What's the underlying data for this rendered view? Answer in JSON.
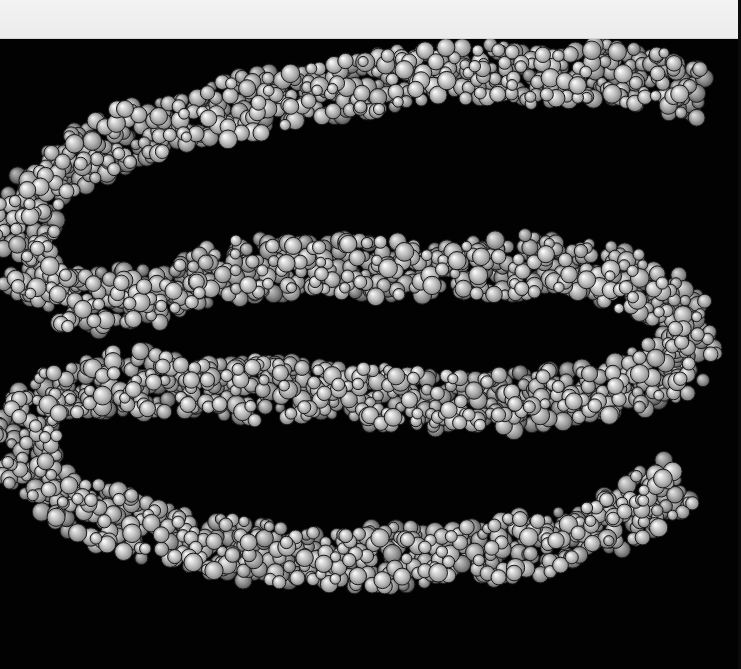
{
  "image": {
    "subject": "space-filling molecular model of a coiled DNA-like double strand",
    "background_color": "#020202",
    "top_band_color": "#efefef",
    "sphere_color": "#9a9a9a",
    "sphere_highlight": "#d8d8d8",
    "sphere_outline": "#1a1a1a"
  },
  "strand_path": [
    [
      700,
      95
    ],
    [
      620,
      70
    ],
    [
      540,
      80
    ],
    [
      450,
      70
    ],
    [
      360,
      85
    ],
    [
      270,
      100
    ],
    [
      180,
      120
    ],
    [
      90,
      150
    ],
    [
      30,
      200
    ],
    [
      20,
      260
    ],
    [
      60,
      300
    ],
    [
      140,
      300
    ],
    [
      230,
      270
    ],
    [
      330,
      265
    ],
    [
      430,
      270
    ],
    [
      520,
      265
    ],
    [
      600,
      270
    ],
    [
      680,
      300
    ],
    [
      690,
      360
    ],
    [
      620,
      390
    ],
    [
      520,
      400
    ],
    [
      420,
      400
    ],
    [
      320,
      390
    ],
    [
      220,
      390
    ],
    [
      120,
      380
    ],
    [
      40,
      400
    ],
    [
      20,
      450
    ],
    [
      60,
      500
    ],
    [
      140,
      530
    ],
    [
      240,
      550
    ],
    [
      340,
      560
    ],
    [
      440,
      555
    ],
    [
      540,
      545
    ],
    [
      620,
      520
    ],
    [
      680,
      480
    ]
  ],
  "strand_width": 62
}
